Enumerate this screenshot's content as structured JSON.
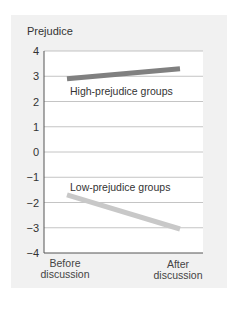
{
  "chart_data": {
    "type": "line",
    "title": "",
    "ylabel": "Prejudice",
    "xlabel": "",
    "categories": [
      "Before discussion",
      "After discussion"
    ],
    "ylim": [
      -4,
      4
    ],
    "yticks": [
      4,
      3,
      2,
      1,
      0,
      -1,
      -2,
      -3,
      -4
    ],
    "ytick_labels": [
      "4",
      "3",
      "2",
      "1",
      "0",
      "−1",
      "−2",
      "−3",
      "−4"
    ],
    "grid": true,
    "legend": "inline-labels",
    "series": [
      {
        "name": "High-prejudice groups",
        "values": [
          2.9,
          3.3
        ],
        "color": "#808080"
      },
      {
        "name": "Low-prejudice groups",
        "values": [
          -1.7,
          -3.05
        ],
        "color": "#c8c8c8"
      }
    ]
  },
  "labels": {
    "ylabel": "Prejudice",
    "x_before_1": "Before",
    "x_before_2": "discussion",
    "x_after_1": "After",
    "x_after_2": "discussion",
    "high_series": "High-prejudice groups",
    "low_series": "Low-prejudice groups"
  }
}
